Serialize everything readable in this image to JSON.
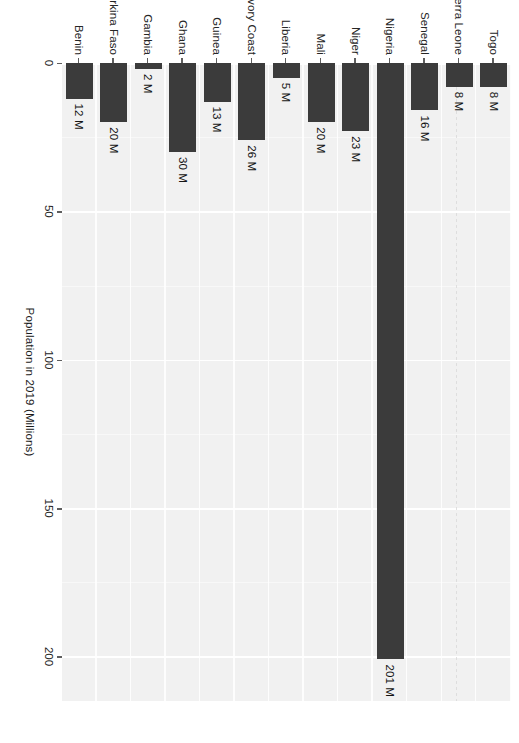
{
  "chart_data": {
    "type": "bar",
    "orientation": "vertical-bars-rotated-90",
    "title": "",
    "subtitle": "",
    "xlabel": "",
    "ylabel": "Population in 2019 (Millions)",
    "categories": [
      "Togo",
      "Sierra Leone",
      "Senegal",
      "Nigeria",
      "Niger",
      "Mali",
      "Liberia",
      "Ivory Coast",
      "Guinea",
      "Ghana",
      "Gambia",
      "Burkina Faso",
      "Benin"
    ],
    "values": [
      8,
      8,
      16,
      201,
      23,
      20,
      5,
      26,
      13,
      30,
      2,
      20,
      12
    ],
    "value_labels": [
      "8 M",
      "8 M",
      "16 M",
      "201 M",
      "23 M",
      "20 M",
      "5 M",
      "26 M",
      "13 M",
      "30 M",
      "2 M",
      "20 M",
      "12 M"
    ],
    "ylim": [
      0,
      215
    ],
    "tick_values": [
      0,
      50,
      100,
      150,
      200
    ],
    "tick_labels": [
      "0",
      "50",
      "100",
      "150",
      "200"
    ],
    "minor_tick_values": [
      25,
      75,
      125,
      175
    ],
    "grid": true,
    "legend": "none",
    "bar_color": "#3B3B3B",
    "panel_color": "#F1F1F1",
    "gridline_color": "#FFFFFF"
  },
  "axis": {
    "value_axis_title": "Population in 2019 (Millions)"
  }
}
